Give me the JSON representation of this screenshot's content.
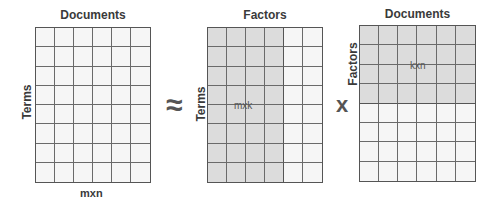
{
  "matrices": [
    {
      "title": "Documents",
      "side_label": "Terms",
      "bottom_label": "mxn",
      "inner_label": "",
      "rows": 8,
      "cols": 6,
      "shaded": "none"
    },
    {
      "title": "Factors",
      "side_label": "Terms",
      "bottom_label": "",
      "inner_label": "mxk",
      "rows": 8,
      "cols": 6,
      "shaded": "first 4 columns"
    },
    {
      "title": "Documents",
      "side_label": "Factors",
      "bottom_label": "",
      "inner_label": "kxn",
      "rows": 8,
      "cols": 6,
      "shaded": "first 4 rows"
    }
  ],
  "operators": {
    "approx": "≈",
    "times": "x"
  },
  "colors": {
    "cell": "#f6f6f6",
    "shaded": "#dcdcdc",
    "line": "#6a6a6a"
  }
}
